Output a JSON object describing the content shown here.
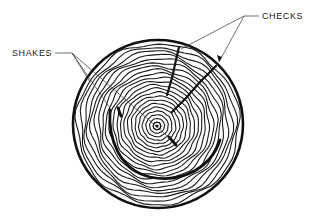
{
  "diagram": {
    "labels": {
      "shakes": "SHAKES",
      "checks": "CHECKS"
    },
    "colors": {
      "ink": "#111111",
      "background": "#ffffff"
    },
    "geometry": {
      "center": [
        157,
        126
      ],
      "outer_radius_x": 85,
      "outer_radius_y": 84,
      "ring_count": 22
    }
  }
}
